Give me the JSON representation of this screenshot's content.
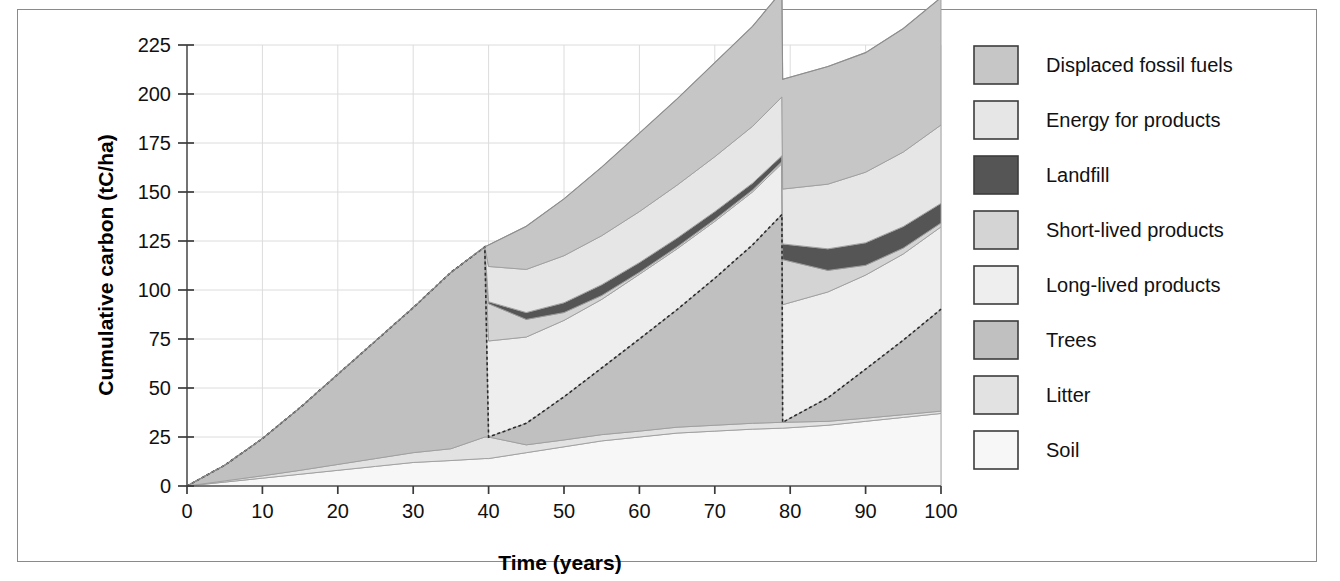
{
  "figure": {
    "has_border": true,
    "background": "#ffffff"
  },
  "axes": {
    "y_title": "Cumulative carbon (tC/ha)",
    "x_title": "Time (years)",
    "y_ticks": [
      "0",
      "25",
      "50",
      "75",
      "100",
      "125",
      "150",
      "175",
      "200",
      "225"
    ],
    "x_ticks": [
      "0",
      "10",
      "20",
      "30",
      "40",
      "50",
      "60",
      "70",
      "80",
      "90",
      "100"
    ]
  },
  "legend": {
    "items": [
      {
        "label": "Displaced fossil fuels",
        "color": "#c6c6c6"
      },
      {
        "label": "Energy for products",
        "color": "#e6e6e6"
      },
      {
        "label": "Landfill",
        "color": "#555555"
      },
      {
        "label": "Short-lived products",
        "color": "#d4d4d4"
      },
      {
        "label": "Long-lived products",
        "color": "#eeeeee"
      },
      {
        "label": "Trees",
        "color": "#c0c0c0"
      },
      {
        "label": "Litter",
        "color": "#e2e2e2"
      },
      {
        "label": "Soil",
        "color": "#f7f7f7"
      }
    ]
  },
  "chart_data": {
    "type": "area",
    "title": "",
    "xlabel": "Time (years)",
    "ylabel": "Cumulative carbon (tC/ha)",
    "xlim": [
      0,
      100
    ],
    "ylim": [
      0,
      225
    ],
    "grid": true,
    "legend_position": "right",
    "stacking": "stacked",
    "x": [
      0,
      5,
      10,
      15,
      20,
      25,
      30,
      35,
      39.5,
      40,
      45,
      50,
      55,
      60,
      65,
      70,
      75,
      78.9,
      79,
      85,
      90,
      95,
      100
    ],
    "series": [
      {
        "name": "Soil",
        "color": "#f7f7f7",
        "values": [
          0,
          2,
          4,
          6,
          8,
          10,
          12,
          13,
          14,
          14,
          17,
          20,
          23,
          25,
          27,
          28,
          29,
          29.5,
          29.5,
          31,
          33,
          35,
          37
        ]
      },
      {
        "name": "Litter",
        "color": "#e2e2e2",
        "values": [
          0,
          0.6,
          1.2,
          2,
          3,
          4,
          5,
          6,
          11,
          11,
          4,
          3.5,
          3.2,
          3,
          3,
          3,
          3,
          3,
          3,
          2,
          1.6,
          1.4,
          1.2
        ]
      },
      {
        "name": "Trees",
        "color": "#c0c0c0",
        "values": [
          0,
          8,
          19,
          32,
          46,
          60,
          74,
          90,
          97,
          0,
          11,
          22,
          34,
          47,
          60,
          75,
          91,
          106,
          0,
          12,
          25,
          38,
          52
        ]
      },
      {
        "name": "Long-lived products",
        "color": "#eeeeee",
        "values": [
          0,
          0,
          0,
          0,
          0,
          0,
          0,
          0,
          0,
          49,
          44,
          39,
          35,
          33,
          31,
          29,
          27,
          26,
          60,
          54,
          48,
          44,
          42
        ]
      },
      {
        "name": "Short-lived products",
        "color": "#d4d4d4",
        "values": [
          0,
          0,
          0,
          0,
          0,
          0,
          0,
          0,
          0,
          19,
          9,
          4,
          2,
          1,
          1,
          1,
          1,
          1,
          23,
          11,
          5,
          3,
          2
        ]
      },
      {
        "name": "Landfill",
        "color": "#555555",
        "values": [
          0,
          0,
          0,
          0,
          0,
          0,
          0,
          0,
          0,
          1,
          3.5,
          5,
          5.5,
          5,
          4.5,
          4,
          3.5,
          3,
          8,
          11,
          11.5,
          11,
          10
        ]
      },
      {
        "name": "Energy for products",
        "color": "#e6e6e6",
        "values": [
          0,
          0,
          0,
          0,
          0,
          0,
          0,
          0,
          0,
          18,
          22,
          24,
          25,
          26,
          27,
          28,
          29,
          30,
          28,
          33,
          36,
          38,
          40
        ]
      },
      {
        "name": "Displaced fossil fuels",
        "color": "#c6c6c6",
        "values": [
          0,
          0,
          0,
          0,
          0,
          0,
          0,
          0,
          0,
          11,
          22,
          29,
          35,
          40,
          44,
          48,
          51,
          54,
          56,
          60,
          61,
          63,
          65
        ]
      }
    ],
    "annotations": [
      {
        "text": "harvest",
        "x": 40
      },
      {
        "text": "harvest",
        "x": 79
      }
    ]
  }
}
